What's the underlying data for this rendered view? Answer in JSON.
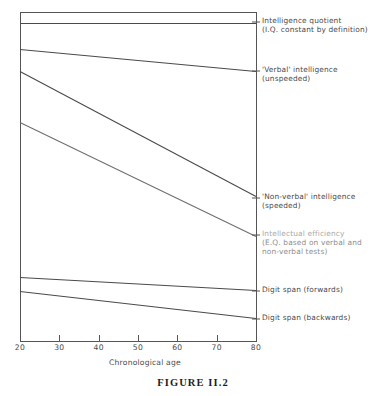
{
  "figure": {
    "caption": "FIGURE II.2",
    "caption_x": 0,
    "caption_y": 377
  },
  "axes": {
    "x_title": "Chronological age",
    "x_title_y": 358,
    "x_ticks": [
      "20",
      "30",
      "40",
      "50",
      "60",
      "70",
      "80"
    ],
    "x_tick_values": [
      20,
      30,
      40,
      50,
      60,
      70,
      80
    ],
    "x_tick_label_y": 343,
    "frame": {
      "left": 20,
      "right": 256,
      "top": 12,
      "bottom": 341
    },
    "stroke": "#555555",
    "y_axis_label": ""
  },
  "chart_data": {
    "type": "line",
    "title": "FIGURE II.2",
    "xlabel": "Chronological age",
    "ylabel": "",
    "xlim": [
      20,
      80
    ],
    "ylim": [
      0,
      1
    ],
    "grid": false,
    "legend": "right-inline-labels",
    "x": [
      20,
      80
    ],
    "series": [
      {
        "name": "Intelligence quotient (I.Q. constant by definition)",
        "label_lines": [
          "Intelligence quotient",
          "(I.Q. constant by definition)"
        ],
        "values": [
          0.966,
          0.966
        ],
        "px": [
          [
            20,
            23
          ],
          [
            256,
            23
          ]
        ],
        "label_px": [
          262,
          16
        ],
        "faded": false
      },
      {
        "name": "'Verbal' intelligence (unspeeded)",
        "label_lines": [
          "'Verbal' intelligence",
          "(unspeeded)"
        ],
        "values": [
          0.887,
          0.82
        ],
        "px": [
          [
            20,
            49
          ],
          [
            256,
            71
          ]
        ],
        "label_px": [
          262,
          65
        ],
        "faded": false
      },
      {
        "name": "'Non-verbal' intelligence (speeded)",
        "label_lines": [
          "'Non-verbal' intelligence",
          "(speeded)"
        ],
        "values": [
          0.82,
          0.44
        ],
        "px": [
          [
            20,
            71
          ],
          [
            256,
            196
          ]
        ],
        "label_px": [
          262,
          192
        ],
        "faded": false
      },
      {
        "name": "Intellectual efficiency (E.Q. based on verbal and non-verbal tests)",
        "label_lines": [
          "Intellectual efficiency",
          "(E.Q. based on verbal and",
          "non-verbal tests)"
        ],
        "values": [
          0.665,
          0.319
        ],
        "px": [
          [
            20,
            122
          ],
          [
            256,
            236
          ]
        ],
        "label_px": [
          262,
          229
        ],
        "faded": true
      },
      {
        "name": "Digit span (forwards)",
        "label_lines": [
          "Digit span (forwards)"
        ],
        "values": [
          0.195,
          0.155
        ],
        "px": [
          [
            20,
            277
          ],
          [
            256,
            290
          ]
        ],
        "label_px": [
          262,
          285
        ],
        "faded": false
      },
      {
        "name": "Digit span (backwards)",
        "label_lines": [
          "Digit span (backwards)"
        ],
        "values": [
          0.152,
          0.07
        ],
        "px": [
          [
            20,
            291
          ],
          [
            256,
            318
          ]
        ],
        "label_px": [
          262,
          313
        ],
        "faded": false
      }
    ]
  }
}
